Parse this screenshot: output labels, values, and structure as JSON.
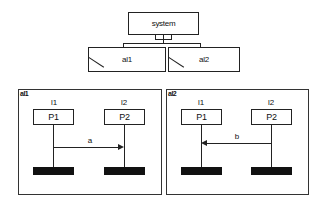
{
  "hierarchy": {
    "root": {
      "label": "system"
    },
    "children": [
      {
        "id": "al1",
        "label": "al1"
      },
      {
        "id": "al2",
        "label": "al2"
      }
    ]
  },
  "panels": [
    {
      "title": "al1",
      "lifelines": [
        {
          "role": "l1",
          "label": "P1"
        },
        {
          "role": "l2",
          "label": "P2"
        }
      ],
      "message": {
        "label": "a",
        "from": "l1",
        "to": "l2",
        "direction": "right"
      }
    },
    {
      "title": "al2",
      "lifelines": [
        {
          "role": "l1",
          "label": "P1"
        },
        {
          "role": "l2",
          "label": "P2"
        }
      ],
      "message": {
        "label": "b",
        "from": "l2",
        "to": "l1",
        "direction": "left"
      }
    }
  ],
  "colors": {
    "line": "#222222",
    "bar": "#111111",
    "background": "#ffffff"
  }
}
